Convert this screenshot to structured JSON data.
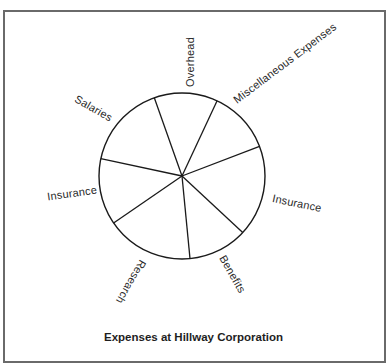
{
  "chart_data": {
    "type": "pie",
    "title": "Expenses at Hillway Corporation",
    "categories": [
      "Overhead",
      "Miscellaneous Expenses",
      "Insurance",
      "Benefits",
      "Research",
      "Insurance",
      "Salaries"
    ],
    "values": [
      12.4,
      12.2,
      17.8,
      11.5,
      17.0,
      12.9,
      16.3
    ],
    "value_units": "percent (estimated from slice angles; no values printed)",
    "boundary_bearings_deg": [
      340.5,
      25,
      69,
      133,
      174.5,
      235.5,
      282
    ],
    "fill": "none",
    "stroke": "#1a1a1a",
    "legend": "none (labels placed around circle)",
    "grid": false
  },
  "geometry": {
    "cx": 182,
    "cy": 176,
    "r": 83
  },
  "labels": {
    "overhead": "Overhead",
    "misc": "Miscellaneous Expenses",
    "insurance_right": "Insurance",
    "benefits": "Benefits",
    "research": "Research",
    "insurance_left": "Insurance",
    "salaries": "Salaries"
  },
  "title": "Expenses at Hillway Corporation"
}
